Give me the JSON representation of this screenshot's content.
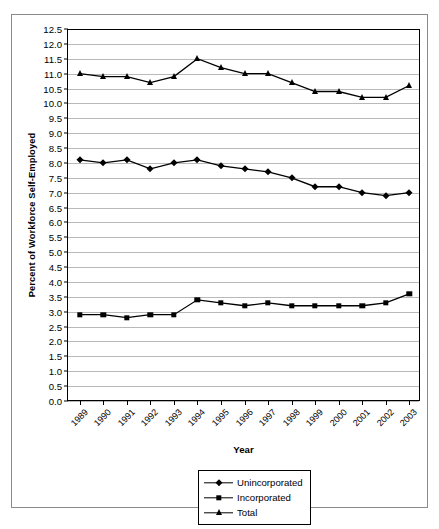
{
  "chart_data": {
    "type": "line",
    "title": "",
    "xlabel": "Year",
    "ylabel": "Percent of Workforce Self-Employed",
    "categories": [
      "1989",
      "1990",
      "1991",
      "1992",
      "1993",
      "1994",
      "1995",
      "1996",
      "1997",
      "1998",
      "1999",
      "2000",
      "2001",
      "2002",
      "2003"
    ],
    "ylim": [
      0.0,
      12.5
    ],
    "ytick_labels": [
      "0.0",
      "0.5",
      "1.0",
      "1.5",
      "2.0",
      "2.5",
      "3.0",
      "3.5",
      "4.0",
      "4.5",
      "5.0",
      "5.5",
      "6.0",
      "6.5",
      "7.0",
      "7.5",
      "8.0",
      "8.5",
      "9.0",
      "9.5",
      "10.0",
      "10.5",
      "11.0",
      "11.5",
      "12.0",
      "12.5"
    ],
    "ytick_values": [
      0.0,
      0.5,
      1.0,
      1.5,
      2.0,
      2.5,
      3.0,
      3.5,
      4.0,
      4.5,
      5.0,
      5.5,
      6.0,
      6.5,
      7.0,
      7.5,
      8.0,
      8.5,
      9.0,
      9.5,
      10.0,
      10.5,
      11.0,
      11.5,
      12.0,
      12.5
    ],
    "grid": true,
    "legend_position": "bottom-center",
    "series": [
      {
        "name": "Unincorporated",
        "marker": "diamond",
        "color": "#000000",
        "values": [
          8.1,
          8.0,
          8.1,
          7.8,
          8.0,
          8.1,
          7.9,
          7.8,
          7.7,
          7.5,
          7.2,
          7.2,
          7.0,
          6.9,
          7.0
        ]
      },
      {
        "name": "Incorporated",
        "marker": "square",
        "color": "#000000",
        "values": [
          2.9,
          2.9,
          2.8,
          2.9,
          2.9,
          3.4,
          3.3,
          3.2,
          3.3,
          3.2,
          3.2,
          3.2,
          3.2,
          3.3,
          3.6
        ]
      },
      {
        "name": "Total",
        "marker": "triangle",
        "color": "#000000",
        "values": [
          11.0,
          10.9,
          10.9,
          10.7,
          10.9,
          11.5,
          11.2,
          11.0,
          11.0,
          10.7,
          10.4,
          10.4,
          10.2,
          10.2,
          10.6
        ]
      }
    ]
  },
  "figure": {
    "border_color": "#8a8a8a",
    "background": "#ffffff",
    "gridline_color": "#b9b9b9",
    "axis_color": "#000000"
  }
}
